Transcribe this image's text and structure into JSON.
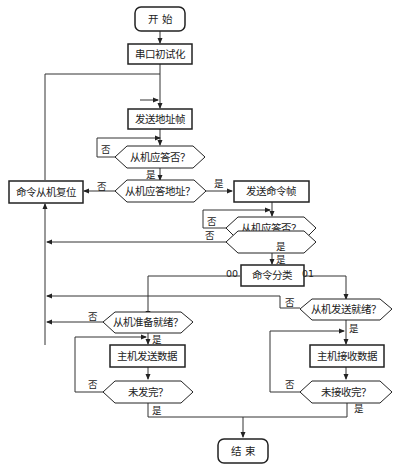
{
  "nodes": {
    "start": "开 始",
    "init": "串口初试化",
    "send_addr": "发送地址帧",
    "slave_resp1": "从机应答否？",
    "slave_resp_addr": "从机应答地址？",
    "reset_slave": "命令从机复位",
    "send_cmd": "发送命令帧",
    "slave_resp2": "从机应答否？",
    "cmd_correct": "命令正确否？",
    "cmd_classify": "命令分类",
    "slave_ready": "从机准备就绪？",
    "slave_send_ready": "从机发送就绪？",
    "host_send": "主机发送数据",
    "host_recv": "主机接收数据",
    "not_sent_done": "未发完？",
    "not_recv_done": "未接收完？",
    "end": "结 束"
  },
  "labels": {
    "yes": "是",
    "no": "否",
    "code00": "00",
    "code01": "01"
  }
}
